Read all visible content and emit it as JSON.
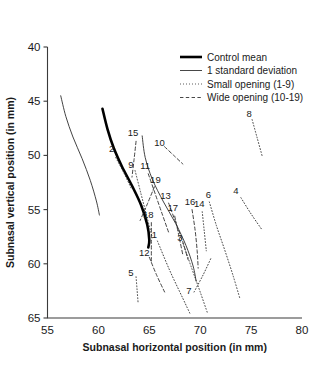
{
  "chart_data": {
    "type": "line",
    "title": "",
    "xlabel": "Subnasal horizontal position (in mm)",
    "ylabel": "Subnasal vertical position (in mm)",
    "xlim": [
      55,
      80
    ],
    "ylim": [
      65,
      40
    ],
    "y_inverted": true,
    "grid": false,
    "xticks": [
      55,
      60,
      65,
      70,
      75,
      80
    ],
    "yticks": [
      40,
      45,
      50,
      55,
      60,
      65
    ],
    "xtick_labels": [
      "55",
      "60",
      "65",
      "70",
      "75",
      "80"
    ],
    "ytick_labels": [
      "40",
      "45",
      "50",
      "55",
      "60",
      "65"
    ],
    "legend_position": "top-right",
    "legend": [
      {
        "label": "Control mean",
        "style": "thick-solid",
        "color": "#000000",
        "width": 2.6
      },
      {
        "label": "1 standard deviation",
        "style": "thin-solid",
        "color": "#333333",
        "width": 0.9
      },
      {
        "label": "Small opening (1-9)",
        "style": "dotted",
        "color": "#333333",
        "width": 0.9
      },
      {
        "label": "Wide opening (10-19)",
        "style": "dashed",
        "color": "#333333",
        "width": 0.9
      }
    ],
    "series": [
      {
        "name": "Control mean",
        "style": "thick-solid",
        "points": [
          [
            60.4,
            45.7
          ],
          [
            60.9,
            47.6
          ],
          [
            61.5,
            49.3
          ],
          [
            62.3,
            51.0
          ],
          [
            63.3,
            52.8
          ],
          [
            64.2,
            54.6
          ],
          [
            64.8,
            56.4
          ],
          [
            65.0,
            57.8
          ],
          [
            64.9,
            58.5
          ]
        ]
      },
      {
        "name": "-1 standard deviation",
        "style": "thin-solid",
        "points": [
          [
            56.3,
            44.5
          ],
          [
            56.8,
            46.4
          ],
          [
            57.5,
            48.3
          ],
          [
            58.4,
            50.3
          ],
          [
            59.2,
            52.3
          ],
          [
            59.8,
            54.2
          ],
          [
            60.1,
            55.5
          ]
        ]
      },
      {
        "name": "+1 standard deviation",
        "style": "thin-solid",
        "points": [
          [
            64.3,
            48.2
          ],
          [
            64.6,
            50.2
          ],
          [
            65.3,
            52.2
          ],
          [
            66.4,
            54.3
          ],
          [
            67.6,
            56.3
          ],
          [
            68.6,
            58.3
          ],
          [
            69.3,
            60.2
          ],
          [
            69.6,
            61.6
          ]
        ]
      },
      {
        "name": "2",
        "label": "2",
        "style": "dotted",
        "group": "small",
        "label_at": [
          61.3,
          49.7
        ],
        "points": [
          [
            61.7,
            50.2
          ],
          [
            62.5,
            51.6
          ],
          [
            63.2,
            53.0
          ]
        ]
      },
      {
        "name": "9",
        "label": "9",
        "style": "dotted",
        "group": "small",
        "label_at": [
          63.2,
          51.2
        ],
        "points": [
          [
            63.6,
            51.4
          ],
          [
            64.2,
            53.6
          ],
          [
            64.8,
            55.8
          ],
          [
            65.3,
            57.6
          ]
        ]
      },
      {
        "name": "5",
        "label": "5",
        "style": "dotted",
        "group": "small",
        "label_at": [
          63.2,
          61.1
        ],
        "points": [
          [
            63.7,
            61.2
          ],
          [
            63.8,
            62.4
          ],
          [
            63.9,
            63.6
          ]
        ]
      },
      {
        "name": "1",
        "label": "1",
        "style": "dotted",
        "group": "small",
        "label_at": [
          65.5,
          57.6
        ],
        "points": [
          [
            65.8,
            57.9
          ],
          [
            67.0,
            60.6
          ],
          [
            68.3,
            63.2
          ],
          [
            69.0,
            64.6
          ]
        ]
      },
      {
        "name": "3",
        "label": "3",
        "style": "dotted",
        "group": "small",
        "label_at": [
          68.0,
          57.9
        ],
        "points": [
          [
            68.3,
            58.1
          ],
          [
            69.2,
            60.5
          ],
          [
            70.0,
            62.6
          ],
          [
            70.7,
            64.5
          ]
        ]
      },
      {
        "name": "7",
        "label": "7",
        "style": "dotted",
        "group": "small",
        "label_at": [
          68.9,
          62.8
        ],
        "points": [
          [
            69.4,
            62.6
          ],
          [
            70.3,
            61.0
          ],
          [
            71.1,
            59.4
          ]
        ]
      },
      {
        "name": "6",
        "label": "6",
        "style": "dotted",
        "group": "small",
        "label_at": [
          70.8,
          53.9
        ],
        "points": [
          [
            70.9,
            54.3
          ],
          [
            71.6,
            56.5
          ],
          [
            72.4,
            58.7
          ],
          [
            73.2,
            61.0
          ],
          [
            73.9,
            63.2
          ]
        ]
      },
      {
        "name": "14",
        "label": "14",
        "style": "dotted",
        "group": "small",
        "label_at": [
          69.9,
          54.8
        ],
        "points": [
          [
            70.2,
            55.2
          ],
          [
            70.4,
            57.0
          ],
          [
            70.6,
            58.8
          ]
        ]
      },
      {
        "name": "4",
        "label": "4",
        "style": "dotted",
        "group": "small",
        "label_at": [
          73.5,
          53.6
        ],
        "points": [
          [
            74.0,
            53.9
          ],
          [
            75.0,
            55.4
          ],
          [
            76.1,
            56.9
          ]
        ]
      },
      {
        "name": "8",
        "label": "8",
        "style": "dotted",
        "group": "small",
        "label_at": [
          74.8,
          46.5
        ],
        "points": [
          [
            75.1,
            46.7
          ],
          [
            75.6,
            48.4
          ],
          [
            76.1,
            50.1
          ]
        ]
      },
      {
        "name": "15",
        "label": "15",
        "style": "dashed",
        "group": "wide",
        "label_at": [
          63.4,
          48.2
        ],
        "points": [
          [
            63.7,
            48.7
          ],
          [
            63.5,
            50.4
          ],
          [
            63.3,
            52.0
          ]
        ]
      },
      {
        "name": "10",
        "label": "10",
        "style": "dashed",
        "group": "wide",
        "label_at": [
          66.0,
          49.1
        ],
        "points": [
          [
            66.5,
            49.2
          ],
          [
            67.4,
            50.0
          ],
          [
            68.3,
            50.8
          ]
        ]
      },
      {
        "name": "11",
        "label": "11",
        "style": "dashed",
        "group": "wide",
        "label_at": [
          64.6,
          51.3
        ],
        "points": [
          [
            64.9,
            51.7
          ],
          [
            65.6,
            53.6
          ],
          [
            66.3,
            55.5
          ],
          [
            66.9,
            57.1
          ]
        ]
      },
      {
        "name": "19",
        "label": "19",
        "style": "dashed",
        "group": "wide",
        "label_at": [
          65.6,
          52.5
        ],
        "points": [
          [
            65.5,
            52.9
          ],
          [
            64.8,
            54.5
          ],
          [
            64.1,
            56.0
          ]
        ]
      },
      {
        "name": "13",
        "label": "13",
        "style": "dashed",
        "group": "wide",
        "label_at": [
          66.6,
          54.0
        ],
        "points": [
          [
            66.9,
            54.4
          ],
          [
            67.6,
            56.2
          ],
          [
            68.3,
            58.0
          ],
          [
            68.8,
            59.6
          ]
        ]
      },
      {
        "name": "17",
        "label": "17",
        "style": "dashed",
        "group": "wide",
        "label_at": [
          67.3,
          55.1
        ],
        "points": [
          [
            67.5,
            55.6
          ],
          [
            67.9,
            57.4
          ],
          [
            68.3,
            59.2
          ]
        ]
      },
      {
        "name": "18",
        "label": "18",
        "style": "dashed",
        "group": "wide",
        "label_at": [
          64.9,
          55.8
        ],
        "points": [
          [
            65.2,
            56.2
          ],
          [
            65.2,
            58.1
          ],
          [
            65.2,
            59.9
          ]
        ]
      },
      {
        "name": "16",
        "label": "16",
        "style": "dashed",
        "group": "wide",
        "label_at": [
          69.0,
          54.6
        ],
        "points": [
          [
            69.2,
            55.0
          ],
          [
            69.5,
            56.9
          ],
          [
            69.7,
            58.8
          ],
          [
            69.8,
            60.4
          ]
        ]
      },
      {
        "name": "12",
        "label": "12",
        "style": "dashed",
        "group": "wide",
        "label_at": [
          64.5,
          59.3
        ],
        "points": [
          [
            65.0,
            59.4
          ],
          [
            65.7,
            61.0
          ],
          [
            66.5,
            62.6
          ]
        ]
      }
    ]
  }
}
